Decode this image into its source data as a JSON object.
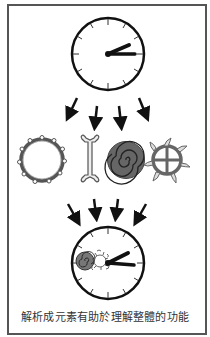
{
  "diagram": {
    "caption": "解析成元素有助於理解整體的功能",
    "colors": {
      "frame": "#555555",
      "ink": "#111111",
      "symbol_gray": "#555555",
      "background": "#ffffff"
    },
    "top_clock": {
      "label": "whole-clock",
      "center": [
        108,
        54
      ],
      "radius": 36,
      "ticks": 12
    },
    "arrows_top": {
      "count": 4,
      "direction": "diverging-down"
    },
    "elements": [
      {
        "name": "toothed-ring"
      },
      {
        "name": "wrench-bar"
      },
      {
        "name": "spiral-disc"
      },
      {
        "name": "cross-wheel-sun"
      }
    ],
    "arrows_bottom": {
      "count": 4,
      "direction": "converging-down"
    },
    "bottom_clock": {
      "label": "reassembled-clock",
      "center": [
        108,
        263
      ],
      "radius": 36,
      "ticks": 12
    }
  }
}
